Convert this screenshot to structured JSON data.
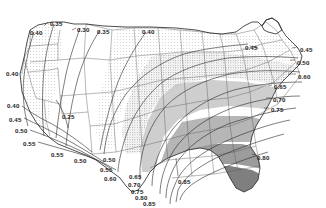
{
  "figure": {
    "title": "AVERAGE VAPOR PRESSURE IN INCHES",
    "subtitle": "JULY",
    "kind": "contour-map",
    "region": "Contiguous United States"
  },
  "colors": {
    "background": "#ffffff",
    "ink": "#1c1c1c",
    "coastline": "#3a3a3a",
    "state_border": "#555555",
    "contour_line": "#2b2b2b",
    "band_unshaded": "#ffffff",
    "band_stipple_light": "#e6e6e6",
    "band_stipple_medium": "#cfcfcf",
    "band_gray_mid": "#b4b4b4",
    "band_gray_dark": "#8f8f8f",
    "band_gray_darkest": "#6e6e6e"
  },
  "chart_data": {
    "type": "contour",
    "title": "AVERAGE VAPOR PRESSURE IN INCHES",
    "subtitle": "JULY",
    "units": "inches of mercury",
    "variable": "Average vapor pressure",
    "period": "July",
    "xlabel": "",
    "ylabel": "",
    "grid": false,
    "legend": "none",
    "contour_interval": 0.05,
    "contour_levels": [
      0.25,
      0.3,
      0.35,
      0.4,
      0.45,
      0.5,
      0.55,
      0.6,
      0.65,
      0.7,
      0.75,
      0.8,
      0.85
    ],
    "value_range": [
      0.25,
      0.85
    ],
    "shading": "monotonic gray ramp, lightest at low vapor pressure (Pacific Northwest / Great Basin), darkest at high vapor pressure (Gulf Coast / Florida)",
    "labels": [
      {
        "text": "0.40",
        "x": 30,
        "y": 30
      },
      {
        "text": "0.35",
        "x": 50,
        "y": 21
      },
      {
        "text": "0.30",
        "x": 77,
        "y": 27
      },
      {
        "text": "0.35",
        "x": 97,
        "y": 29
      },
      {
        "text": "0.40",
        "x": 142,
        "y": 29
      },
      {
        "text": "0.45",
        "x": 245,
        "y": 45
      },
      {
        "text": "0.45",
        "x": 300,
        "y": 47
      },
      {
        "text": "0.50",
        "x": 297,
        "y": 60
      },
      {
        "text": "0.60",
        "x": 298,
        "y": 74
      },
      {
        "text": "0.65",
        "x": 274,
        "y": 84
      },
      {
        "text": "0.70",
        "x": 273,
        "y": 97
      },
      {
        "text": "0.75",
        "x": 271,
        "y": 107
      },
      {
        "text": "0.40",
        "x": 6,
        "y": 71
      },
      {
        "text": "0.40",
        "x": 7,
        "y": 103
      },
      {
        "text": "0.45",
        "x": 9,
        "y": 117
      },
      {
        "text": "0.50",
        "x": 15,
        "y": 128
      },
      {
        "text": "0.55",
        "x": 23,
        "y": 141
      },
      {
        "text": "0.25",
        "x": 62,
        "y": 114
      },
      {
        "text": "0.55",
        "x": 51,
        "y": 152
      },
      {
        "text": "0.50",
        "x": 74,
        "y": 158
      },
      {
        "text": "0.50",
        "x": 103,
        "y": 157
      },
      {
        "text": "0.55",
        "x": 100,
        "y": 167
      },
      {
        "text": "0.60",
        "x": 104,
        "y": 176
      },
      {
        "text": "0.65",
        "x": 129,
        "y": 174
      },
      {
        "text": "0.70",
        "x": 128,
        "y": 182
      },
      {
        "text": "0.75",
        "x": 131,
        "y": 189
      },
      {
        "text": "0.80",
        "x": 135,
        "y": 195
      },
      {
        "text": "0.85",
        "x": 143,
        "y": 201
      },
      {
        "text": "0.85",
        "x": 178,
        "y": 179
      },
      {
        "text": "0.80",
        "x": 257,
        "y": 155
      }
    ],
    "notes": [
      "Vapor pressure increases from northwest to southeast.",
      "Lowest values (0.25-0.30 in) over the interior Northwest and Great Basin.",
      "Highest values (0.85 in) along the central Gulf Coast and peninsular Florida."
    ]
  }
}
